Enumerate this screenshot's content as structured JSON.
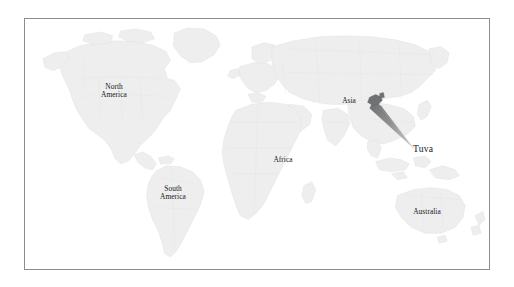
{
  "figure": {
    "kind": "world-map",
    "projection": "equirectangular-world",
    "frame_color": "#8d8d8f",
    "background_color": "#ffffff",
    "land_fill": "#eeeeef",
    "land_border": "#e0e0e2",
    "label_color": "#16181a"
  },
  "map": {
    "labels": [
      {
        "id": "north-america",
        "text": "North\nAmerica",
        "x": 89,
        "y": 83,
        "size": "small"
      },
      {
        "id": "south-america",
        "text": "South\nAmerica",
        "x": 148,
        "y": 185,
        "size": "small"
      },
      {
        "id": "africa",
        "text": "Africa",
        "x": 258,
        "y": 160,
        "size": "small"
      },
      {
        "id": "asia",
        "text": "Asia",
        "x": 344,
        "y": 101,
        "size": "small"
      },
      {
        "id": "australia",
        "text": "Australia",
        "x": 402,
        "y": 212,
        "size": "small"
      }
    ],
    "callout": {
      "id": "tuva",
      "text": "Tuva",
      "label_x": 415,
      "label_y": 145,
      "marker_x": 378,
      "marker_y": 100,
      "marker_color": "#6f7173",
      "cone_color_near": "#6c6e70",
      "cone_color_far": "#d8d9da"
    }
  }
}
